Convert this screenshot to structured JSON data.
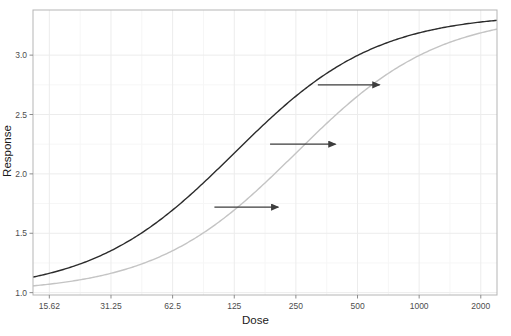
{
  "chart_data": {
    "type": "line",
    "title": "",
    "xlabel": "Dose",
    "ylabel": "Response",
    "x_scale": "log2",
    "xlim": [
      13.0,
      2400
    ],
    "ylim": [
      0.98,
      3.38
    ],
    "grid": true,
    "legend": "none",
    "x_ticks": [
      {
        "value": 15.62,
        "label": "15.62"
      },
      {
        "value": 31.25,
        "label": "31.25"
      },
      {
        "value": 62.5,
        "label": "62.5"
      },
      {
        "value": 125,
        "label": "125"
      },
      {
        "value": 250,
        "label": "250"
      },
      {
        "value": 500,
        "label": "500"
      },
      {
        "value": 1000,
        "label": "1000"
      },
      {
        "value": 2000,
        "label": "2000"
      }
    ],
    "y_ticks": [
      {
        "value": 1.0,
        "label": "1.0"
      },
      {
        "value": 1.5,
        "label": "1.5"
      },
      {
        "value": 2.0,
        "label": "2.0"
      },
      {
        "value": 2.5,
        "label": "2.5"
      },
      {
        "value": 3.0,
        "label": "3.0"
      }
    ],
    "series": [
      {
        "name": "reference-curve",
        "color": "#2b2b2b",
        "width": 1.4,
        "model": "four-parameter-logistic",
        "params": {
          "bottom": 1.0,
          "top": 3.35,
          "ec50": 125,
          "hill": 1.25
        },
        "x": [
          13,
          15.62,
          20,
          31.25,
          45,
          62.5,
          90,
          125,
          175,
          250,
          350,
          500,
          700,
          1000,
          1400,
          2000,
          2400
        ],
        "y": [
          1.05,
          1.08,
          1.14,
          1.29,
          1.47,
          1.68,
          1.96,
          2.2,
          2.48,
          2.75,
          2.95,
          3.08,
          3.17,
          3.22,
          3.25,
          3.27,
          3.28
        ]
      },
      {
        "name": "shifted-curve",
        "color": "#c4c4c4",
        "width": 1.4,
        "model": "four-parameter-logistic",
        "params": {
          "bottom": 1.0,
          "top": 3.35,
          "ec50": 250,
          "hill": 1.25
        },
        "x": [
          13,
          15.62,
          20,
          31.25,
          45,
          62.5,
          90,
          125,
          175,
          250,
          350,
          500,
          700,
          1000,
          1400,
          2000,
          2400
        ],
        "y": [
          1.02,
          1.03,
          1.06,
          1.14,
          1.25,
          1.38,
          1.58,
          1.75,
          1.99,
          2.2,
          2.5,
          2.75,
          2.95,
          3.08,
          3.16,
          3.21,
          3.23
        ]
      }
    ],
    "annotations": [
      {
        "type": "arrow",
        "name": "shift-arrow-low",
        "x_start": 100,
        "y_start": 1.72,
        "x_end": 205,
        "y_end": 1.72
      },
      {
        "type": "arrow",
        "name": "shift-arrow-mid",
        "x_start": 187,
        "y_start": 2.25,
        "x_end": 390,
        "y_end": 2.25
      },
      {
        "type": "arrow",
        "name": "shift-arrow-high",
        "x_start": 320,
        "y_start": 2.75,
        "x_end": 640,
        "y_end": 2.75
      }
    ],
    "arrow_color": "#3d3d3d",
    "panel_border_color": "#b5b5b5",
    "grid_color": "#ececec",
    "background": "#ffffff"
  }
}
